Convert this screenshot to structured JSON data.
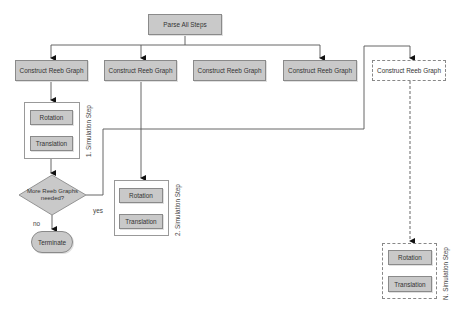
{
  "diagram": {
    "root": {
      "label": "Parse All Steps"
    },
    "construct_boxes": [
      {
        "label": "Construct Reeb Graph"
      },
      {
        "label": "Construct Reeb Graph"
      },
      {
        "label": "Construct Reeb Graph"
      },
      {
        "label": "Construct Reeb Graph"
      },
      {
        "label": "Construct Reeb Graph"
      }
    ],
    "sim_steps": [
      {
        "label": "1. Simulation Step",
        "rotation": "Rotation",
        "translation": "Translation"
      },
      {
        "label": "2. Simulation Step",
        "rotation": "Rotation",
        "translation": "Translation"
      },
      {
        "label": "N. Simulation Step",
        "rotation": "Rotation",
        "translation": "Translation"
      }
    ],
    "decision": {
      "label_line1": "More Reeb Graphs",
      "label_line2": "needed?"
    },
    "terminal": {
      "label": "Terminate"
    },
    "edge_labels": {
      "yes": "yes",
      "no": "no"
    },
    "colors": {
      "box_fill": "#c9c9c9",
      "box_border": "#8a8a8a",
      "line": "#555555"
    }
  }
}
